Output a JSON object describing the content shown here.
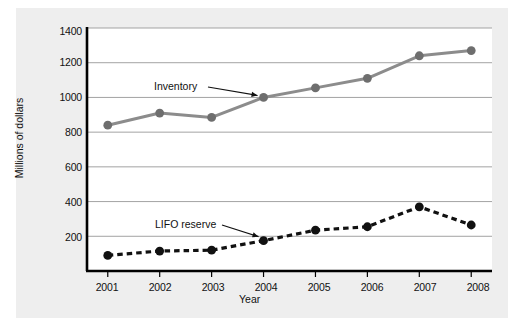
{
  "chart_data": {
    "type": "line",
    "title": "",
    "xlabel": "Year",
    "ylabel": "Millions of dollars",
    "categories": [
      "2001",
      "2002",
      "2003",
      "2004",
      "2005",
      "2006",
      "2007",
      "2008"
    ],
    "x": [
      2001,
      2002,
      2003,
      2004,
      2005,
      2006,
      2007,
      2008
    ],
    "xlim": [
      2000.6,
      2008.4
    ],
    "ylim": [
      0,
      1400
    ],
    "yticks": [
      200,
      400,
      600,
      800,
      1000,
      1200,
      1400
    ],
    "ytick_labels": [
      "200",
      "400",
      "600",
      "800",
      "1000",
      "1200",
      "1400"
    ],
    "grid": "horizontal",
    "legend_position": "inline-annotations",
    "series": [
      {
        "name": "Inventory",
        "style": "solid",
        "color": "#8c8c8c",
        "marker": "circle",
        "marker_color": "#6e6e6e",
        "values": [
          840,
          910,
          885,
          1000,
          1055,
          1110,
          1240,
          1270
        ],
        "annotation": "Inventory",
        "annotation_target_year": 2004
      },
      {
        "name": "LIFO reserve",
        "style": "dashed",
        "color": "#111111",
        "marker": "circle",
        "marker_color": "#111111",
        "values": [
          90,
          115,
          120,
          175,
          235,
          255,
          370,
          265
        ],
        "annotation": "LIFO reserve",
        "annotation_target_year": 2004
      }
    ]
  },
  "colors": {
    "panel_background": "#eeeeee",
    "plot_background": "#ffffff",
    "axis": "#000000",
    "gridline": "#999999",
    "inventory": "#8c8c8c",
    "lifo_reserve": "#111111"
  },
  "axes": {
    "y_tick_1400": "1400",
    "y_tick_1200": "1200",
    "y_tick_1000": "1000",
    "y_tick_800": "800",
    "y_tick_600": "600",
    "y_tick_400": "400",
    "y_tick_200": "200",
    "x_tick_2001": "2001",
    "x_tick_2002": "2002",
    "x_tick_2003": "2003",
    "x_tick_2004": "2004",
    "x_tick_2005": "2005",
    "x_tick_2006": "2006",
    "x_tick_2007": "2007",
    "x_tick_2008": "2008",
    "x_axis_title": "Year",
    "y_axis_title": "Millions of dollars"
  },
  "annotations": {
    "inventory": "Inventory",
    "lifo_reserve": "LIFO reserve"
  }
}
